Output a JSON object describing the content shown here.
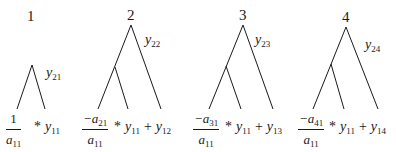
{
  "diagram": {
    "type": "tree-diagram",
    "line_color": "#1a1a1a",
    "trees": [
      {
        "label": "1",
        "branch_label": {
          "var": "y",
          "sub": "21"
        },
        "formula": {
          "numerator": "1",
          "numerator_sub": "",
          "denominator": "a",
          "denominator_sub": "11",
          "times": "*",
          "term1": "y",
          "term1_sub": "11",
          "plus": "",
          "term2": "",
          "term2_sub": ""
        }
      },
      {
        "label": "2",
        "branch_label": {
          "var": "y",
          "sub": "22"
        },
        "formula": {
          "numerator": "−a",
          "numerator_sub": "21",
          "denominator": "a",
          "denominator_sub": "11",
          "times": "*",
          "term1": "y",
          "term1_sub": "11",
          "plus": "+",
          "term2": "y",
          "term2_sub": "12"
        }
      },
      {
        "label": "3",
        "branch_label": {
          "var": "y",
          "sub": "23"
        },
        "formula": {
          "numerator": "−a",
          "numerator_sub": "31",
          "denominator": "a",
          "denominator_sub": "11",
          "times": "*",
          "term1": "y",
          "term1_sub": "11",
          "plus": "+",
          "term2": "y",
          "term2_sub": "13"
        }
      },
      {
        "label": "4",
        "branch_label": {
          "var": "y",
          "sub": "24"
        },
        "formula": {
          "numerator": "−a",
          "numerator_sub": "41",
          "denominator": "a",
          "denominator_sub": "11",
          "times": "*",
          "term1": "y",
          "term1_sub": "11",
          "plus": "+",
          "term2": "y",
          "term2_sub": "14"
        }
      }
    ]
  }
}
